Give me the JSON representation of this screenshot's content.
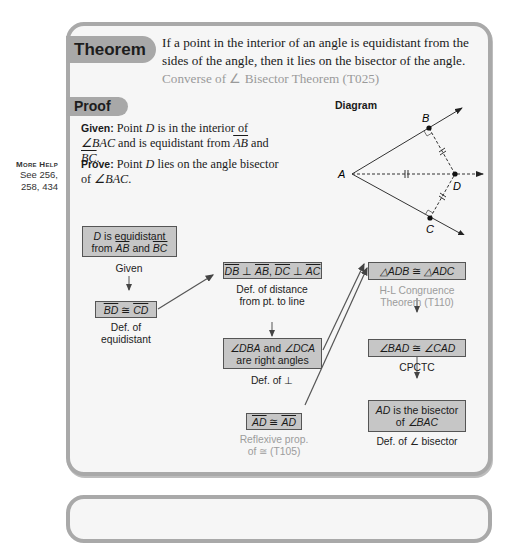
{
  "theorem": {
    "tab_label": "Theorem",
    "statement": "If a point in the interior of an angle is equidistant from the sides of the angle, then it lies on the bisector of the angle.",
    "reference": "Converse of ∠ Bisector Theorem (T025)"
  },
  "more_help": {
    "title": "More Help",
    "pages": "See 256, 258, 434"
  },
  "proof": {
    "tab_label": "Proof",
    "given_label": "Given:",
    "given_text_1": "Point ",
    "given_point": "D",
    "given_text_2": " is in the interior of ",
    "given_angle": "∠BAC",
    "given_text_3": " and is equidistant from ",
    "given_ray1": "AB",
    "given_and": " and ",
    "given_ray2": "BC",
    "given_end": ".",
    "prove_label": "Prove:",
    "prove_text_1": "Point ",
    "prove_point": "D",
    "prove_text_2": " lies on the angle bisector of ",
    "prove_angle": "∠BAC",
    "prove_end": "."
  },
  "diagram": {
    "label": "Diagram",
    "points": {
      "A": "A",
      "B": "B",
      "C": "C",
      "D": "D"
    }
  },
  "flowchart": {
    "steps": [
      {
        "id": "s1",
        "statement": "D is equidistant from AB and BC",
        "reason": "Given"
      },
      {
        "id": "s2",
        "statement": "BD ≅ CD",
        "reason": "Def. of equidistant"
      },
      {
        "id": "s3",
        "statement": "DB ⊥ AB, DC ⊥ AC",
        "reason": "Def. of distance from pt. to line"
      },
      {
        "id": "s4",
        "statement": "∠DBA and ∠DCA are right angles",
        "reason": "Def. of ⊥"
      },
      {
        "id": "s5",
        "statement": "AD ≅ AD",
        "reason": "Reflexive prop. of ≅ (T105)"
      },
      {
        "id": "s6",
        "statement": "△ADB ≅ △ADC",
        "reason": "H-L Congruence Theorem (T110)"
      },
      {
        "id": "s7",
        "statement": "∠BAD ≅ ∠CAD",
        "reason": "CPCTC"
      },
      {
        "id": "s8",
        "statement": "AD is the bisector of ∠BAC",
        "reason": "Def. of ∠ bisector"
      }
    ],
    "s1": {
      "l1_pt": "D",
      "l1_rest": " is equidistant",
      "l2_from": "from ",
      "l2_r1": "AB",
      "l2_and": " and ",
      "l2_r2": "BC"
    },
    "s1_reason": "Given",
    "s2": {
      "a": "BD",
      "op": " ≅ ",
      "b": "CD"
    },
    "s2_reason_1": "Def. of",
    "s2_reason_2": "equidistant",
    "s3": {
      "a": "DB",
      "op1": " ⊥ ",
      "b": "AB",
      "sep": ", ",
      "c": "DC",
      "op2": " ⊥ ",
      "d": "AC"
    },
    "s3_reason_1": "Def. of distance",
    "s3_reason_2": "from pt. to line",
    "s4": {
      "a": "∠DBA",
      "and": " and ",
      "b": "∠DCA",
      "l2": "are right angles"
    },
    "s4_reason": "Def. of ⊥",
    "s5": {
      "a": "AD",
      "op": " ≅ ",
      "b": "AD"
    },
    "s5_reason_1": "Reflexive prop.",
    "s5_reason_2": "of ≅ (T105)",
    "s6": {
      "a": "△ADB",
      "op": " ≅ ",
      "b": "△ADC"
    },
    "s6_reason_1": "H-L Congruence",
    "s6_reason_2": "Theorem (T110)",
    "s7": {
      "a": "∠BAD",
      "op": " ≅ ",
      "b": "∠CAD"
    },
    "s7_reason": "CPCTC",
    "s8": {
      "a": "AD",
      "l1_rest": " is the bisector",
      "l2_of": "of ",
      "l2_angle": "∠BAC"
    },
    "s8_reason": "Def. of ∠ bisector"
  },
  "colors": {
    "card_border": "#a9a9a9",
    "card_bg": "#f6f6f6",
    "tab_bg": "#a8a8a8",
    "box_bg": "#c6c6c6",
    "muted_text": "#9c9c9c"
  }
}
